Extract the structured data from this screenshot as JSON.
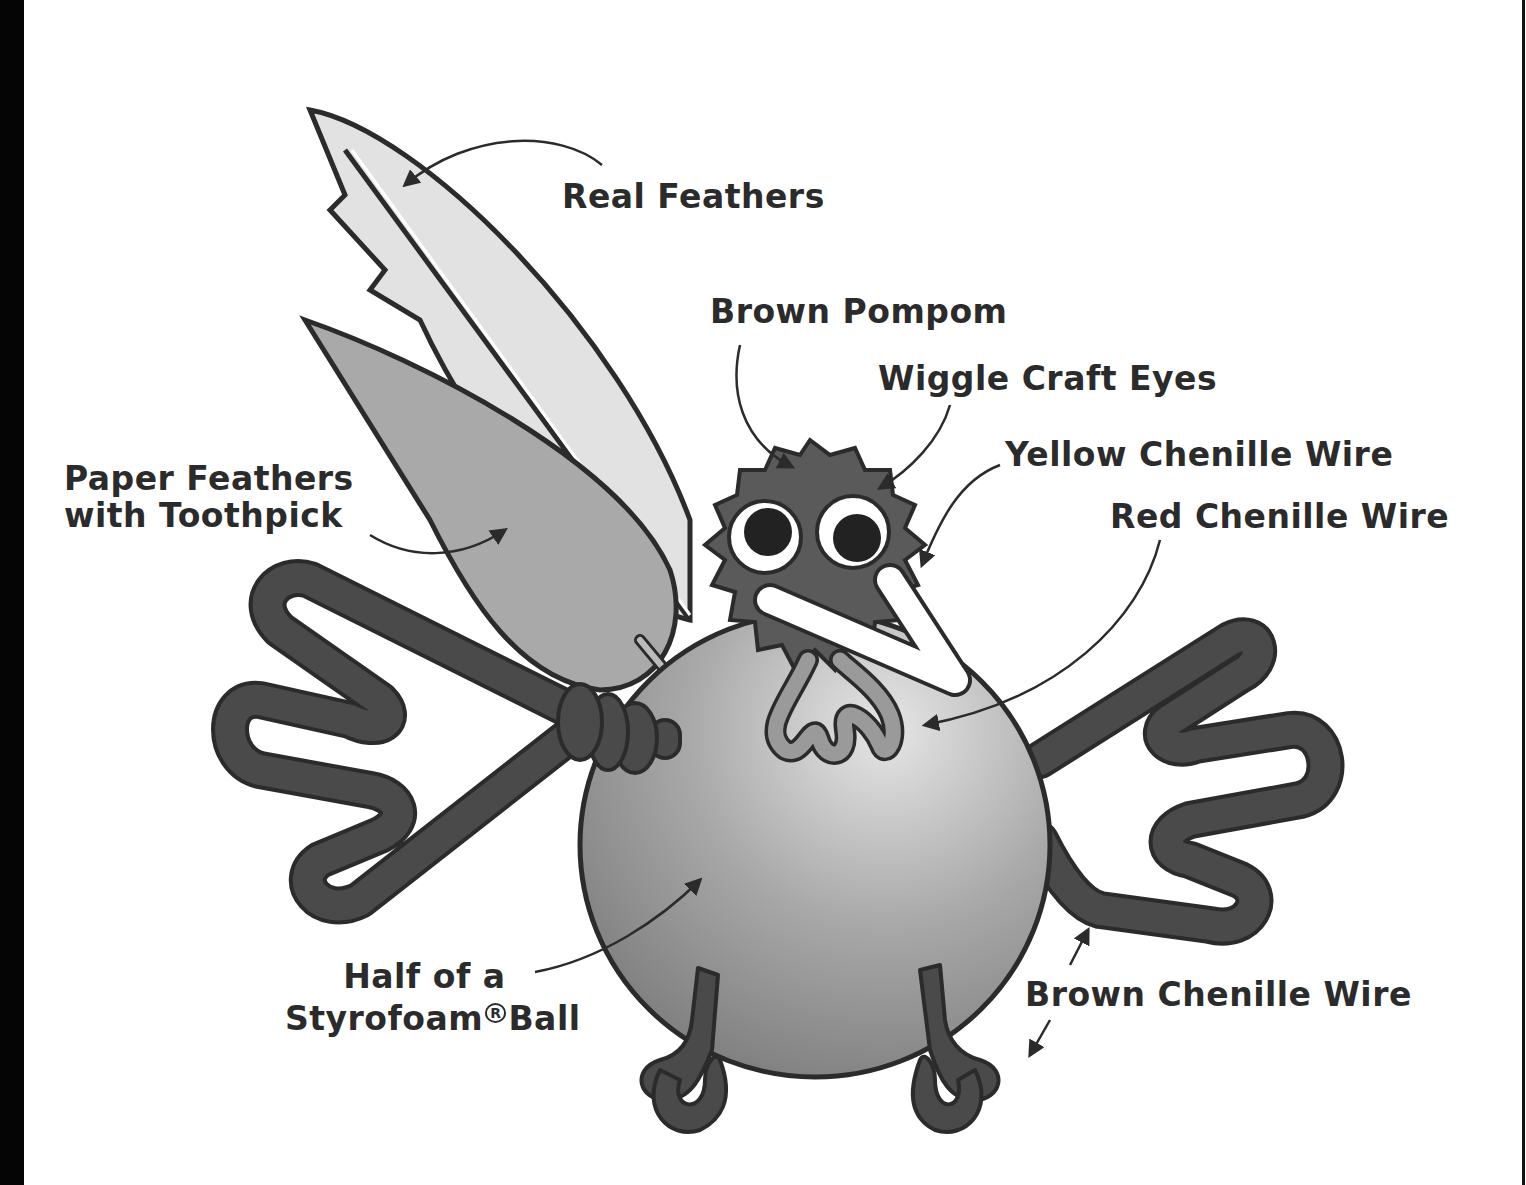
{
  "colors": {
    "outline": "#2b2b2b",
    "pompom": "#5a5a5a",
    "chenille_brown": "#4a4a4a",
    "body_light": "#c9c9c9",
    "body_dark": "#7d7d7d",
    "paper_feather": "#a9a9a9",
    "real_feather": "#e2e2e2",
    "beak": "#ffffff",
    "wattle": "#9a9a9a"
  },
  "labels": {
    "real_feathers": "Real Feathers",
    "brown_pompom": "Brown Pompom",
    "wiggle_eyes": "Wiggle Craft Eyes",
    "yellow_chenille": "Yellow Chenille Wire",
    "red_chenille": "Red Chenille Wire",
    "paper_feathers_line1": "Paper Feathers",
    "paper_feathers_line2": "with Toothpick",
    "styrofoam_line1": "Half of a",
    "styrofoam_line2a": "Styrofoam",
    "styrofoam_reg": "R",
    "styrofoam_line2b": "Ball",
    "brown_chenille": "Brown Chenille Wire"
  }
}
